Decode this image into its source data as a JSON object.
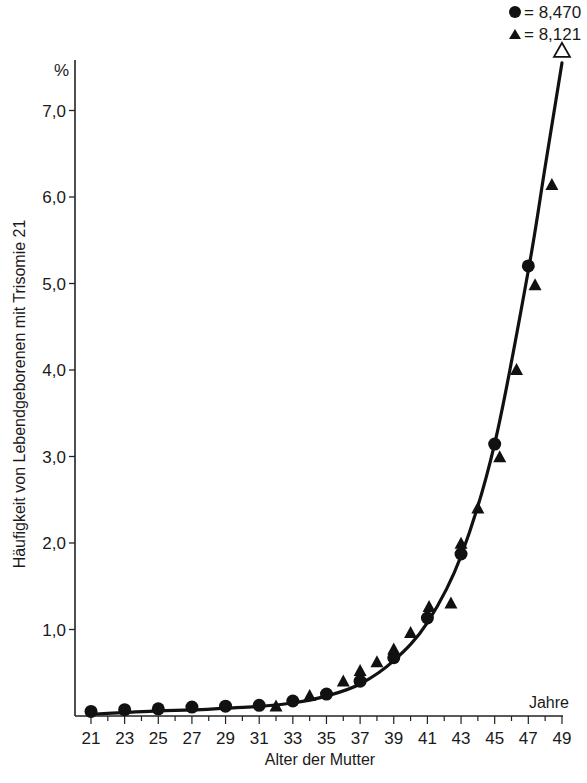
{
  "chart_data": {
    "type": "line",
    "title": "",
    "xlabel": "Alter der Mutter",
    "x_unit_label": "Jahre",
    "ylabel": "Häufigkeit von Lebendgeborenen mit Trisomie 21",
    "y_unit_label": "%",
    "xlim": [
      21,
      49
    ],
    "ylim": [
      0,
      7.5
    ],
    "x_ticks": [
      21,
      23,
      25,
      27,
      29,
      31,
      33,
      35,
      37,
      39,
      41,
      43,
      45,
      47,
      49
    ],
    "x_tick_labels": [
      "21",
      "23",
      "25",
      "27",
      "29",
      "31",
      "33",
      "35",
      "37",
      "39",
      "41",
      "43",
      "45",
      "47",
      "49"
    ],
    "y_ticks": [
      1,
      2,
      3,
      4,
      5,
      6,
      7
    ],
    "y_tick_labels": [
      "1,0",
      "2,0",
      "3,0",
      "4,0",
      "5,0",
      "6,0",
      "7,0"
    ],
    "grid": false,
    "legend_position": "top-right",
    "legend": [
      {
        "marker": "circle",
        "label": "= 8,470"
      },
      {
        "marker": "triangle",
        "label": "= 8,121"
      }
    ],
    "series": [
      {
        "name": "● = 8,470",
        "marker": "circle",
        "x": [
          21,
          23,
          25,
          27,
          29,
          31,
          33,
          35,
          37,
          39,
          41,
          43,
          45,
          47
        ],
        "values": [
          0.03,
          0.05,
          0.06,
          0.08,
          0.09,
          0.1,
          0.15,
          0.23,
          0.38,
          0.65,
          1.11,
          1.85,
          3.12,
          5.18
        ]
      },
      {
        "name": "▲ = 8,121",
        "marker": "triangle",
        "x": [
          32,
          34,
          36,
          37,
          38,
          39,
          40,
          41.1,
          42.4,
          43,
          44,
          45.3,
          46.3,
          47.4,
          48.4
        ],
        "values": [
          0.11,
          0.23,
          0.4,
          0.52,
          0.62,
          0.77,
          0.96,
          1.26,
          1.3,
          1.99,
          2.4,
          2.99,
          4.0,
          4.98,
          6.14
        ]
      },
      {
        "name": "fitted curve",
        "marker": "none",
        "x": [
          21,
          23,
          25,
          27,
          29,
          31,
          33,
          35,
          37,
          39,
          41,
          43,
          45,
          47,
          48,
          49
        ],
        "values": [
          0.02,
          0.04,
          0.06,
          0.07,
          0.09,
          0.11,
          0.15,
          0.23,
          0.37,
          0.64,
          1.08,
          1.85,
          3.15,
          5.15,
          6.35,
          7.55
        ],
        "end_marker": "open-arrow"
      }
    ]
  }
}
